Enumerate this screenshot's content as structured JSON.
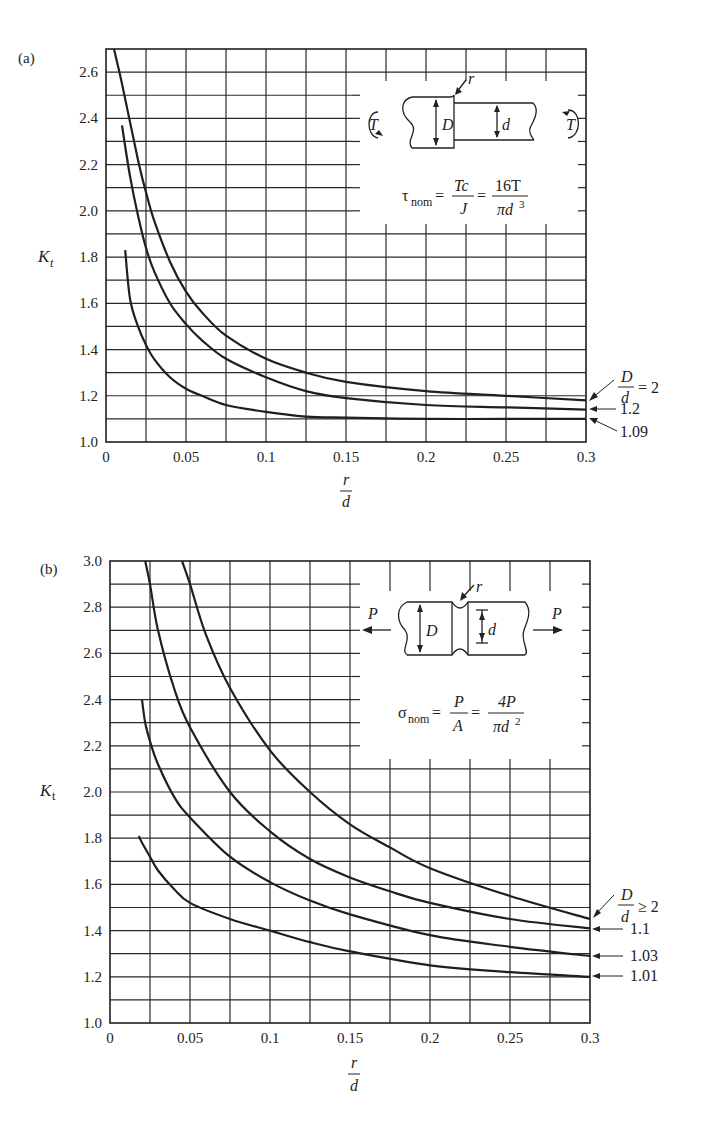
{
  "chart_data": [
    {
      "type": "line",
      "panel": "(a)",
      "title": "Stress concentration factor, stepped shaft in torsion",
      "xlabel": "r/d",
      "ylabel": "K_t",
      "xlim": [
        0,
        0.3
      ],
      "ylim": [
        1.0,
        2.7
      ],
      "xticks": [
        "0",
        "0.05",
        "0.1",
        "0.15",
        "0.2",
        "0.25",
        "0.3"
      ],
      "yticks": [
        "1.0",
        "1.2",
        "1.4",
        "1.6",
        "1.8",
        "2.0",
        "2.2",
        "2.4",
        "2.6"
      ],
      "grid": true,
      "inset": {
        "diagram": "stepped shaft with torque T at both ends, diameters D and d, fillet radius r",
        "formula": "τ_nom = Tc/J = 16T/(πd³)"
      },
      "series": [
        {
          "name": "D/d = 2",
          "x": [
            0.005,
            0.01,
            0.02,
            0.025,
            0.03,
            0.04,
            0.05,
            0.06,
            0.075,
            0.1,
            0.125,
            0.15,
            0.2,
            0.25,
            0.3
          ],
          "y": [
            2.7,
            2.55,
            2.22,
            2.08,
            1.96,
            1.78,
            1.65,
            1.56,
            1.46,
            1.36,
            1.3,
            1.26,
            1.22,
            1.2,
            1.18
          ]
        },
        {
          "name": "1.2",
          "x": [
            0.01,
            0.015,
            0.02,
            0.025,
            0.03,
            0.04,
            0.05,
            0.06,
            0.075,
            0.1,
            0.125,
            0.15,
            0.2,
            0.25,
            0.3
          ],
          "y": [
            2.37,
            2.15,
            1.98,
            1.84,
            1.74,
            1.6,
            1.51,
            1.44,
            1.36,
            1.28,
            1.22,
            1.19,
            1.16,
            1.15,
            1.14
          ]
        },
        {
          "name": "1.09",
          "x": [
            0.012,
            0.015,
            0.02,
            0.025,
            0.03,
            0.04,
            0.05,
            0.06,
            0.075,
            0.1,
            0.125,
            0.15,
            0.2,
            0.25,
            0.3
          ],
          "y": [
            1.83,
            1.62,
            1.5,
            1.42,
            1.36,
            1.28,
            1.23,
            1.2,
            1.16,
            1.13,
            1.11,
            1.105,
            1.1,
            1.1,
            1.1
          ]
        }
      ],
      "annotations": [
        "D/d = 2",
        "1.2",
        "1.09"
      ]
    },
    {
      "type": "line",
      "panel": "(b)",
      "title": "Stress concentration factor, grooved shaft in tension",
      "xlabel": "r/d",
      "ylabel": "K_t",
      "xlim": [
        0,
        0.3
      ],
      "ylim": [
        1.0,
        3.0
      ],
      "xticks": [
        "0",
        "0.05",
        "0.1",
        "0.15",
        "0.2",
        "0.25",
        "0.3"
      ],
      "yticks": [
        "1.0",
        "1.2",
        "1.4",
        "1.6",
        "1.8",
        "2.0",
        "2.2",
        "2.4",
        "2.6",
        "2.8",
        "3.0"
      ],
      "grid": true,
      "inset": {
        "diagram": "grooved round bar under axial load P, diameters D and d, groove radius r",
        "formula": "σ_nom = P/A = 4P/(πd²)"
      },
      "series": [
        {
          "name": "D/d ≥ 2",
          "x": [
            0.045,
            0.05,
            0.06,
            0.075,
            0.1,
            0.125,
            0.15,
            0.175,
            0.2,
            0.25,
            0.3
          ],
          "y": [
            3.0,
            2.9,
            2.68,
            2.45,
            2.18,
            2.0,
            1.86,
            1.76,
            1.67,
            1.55,
            1.45
          ]
        },
        {
          "name": "1.1",
          "x": [
            0.022,
            0.025,
            0.03,
            0.04,
            0.05,
            0.075,
            0.1,
            0.125,
            0.15,
            0.175,
            0.2,
            0.25,
            0.3
          ],
          "y": [
            3.0,
            2.9,
            2.7,
            2.45,
            2.28,
            2.0,
            1.83,
            1.71,
            1.63,
            1.57,
            1.52,
            1.45,
            1.41
          ]
        },
        {
          "name": "1.03",
          "x": [
            0.02,
            0.022,
            0.025,
            0.03,
            0.04,
            0.05,
            0.075,
            0.1,
            0.125,
            0.15,
            0.2,
            0.25,
            0.3
          ],
          "y": [
            2.4,
            2.3,
            2.22,
            2.12,
            1.98,
            1.89,
            1.72,
            1.61,
            1.53,
            1.47,
            1.38,
            1.33,
            1.29
          ]
        },
        {
          "name": "1.01",
          "x": [
            0.018,
            0.02,
            0.025,
            0.03,
            0.04,
            0.05,
            0.075,
            0.1,
            0.125,
            0.15,
            0.2,
            0.25,
            0.3
          ],
          "y": [
            1.81,
            1.78,
            1.72,
            1.66,
            1.58,
            1.52,
            1.45,
            1.4,
            1.35,
            1.31,
            1.25,
            1.22,
            1.2
          ]
        }
      ],
      "annotations": [
        "D/d ≥ 2",
        "1.1",
        "1.03",
        "1.01"
      ]
    }
  ],
  "labels": {
    "a": {
      "panel": "(a)",
      "ylabel": "K",
      "ylabel_sub": "t",
      "xlabel_num": "r",
      "xlabel_den": "d",
      "xticks": [
        "0",
        "0.05",
        "0.1",
        "0.15",
        "0.2",
        "0.25",
        "0.3"
      ],
      "yticks": [
        "1.0",
        "1.2",
        "1.4",
        "1.6",
        "1.8",
        "2.0",
        "2.2",
        "2.4",
        "2.6"
      ],
      "ann_frac_num": "D",
      "ann_frac_den": "d",
      "ann_first": "= 2",
      "ann_2": "1.2",
      "ann_3": "1.09",
      "inset": {
        "T": "T",
        "D": "D",
        "d": "d",
        "r": "r",
        "tau": "τ",
        "nom": "nom",
        "eq": "=",
        "f1_num": "Tc",
        "f1_den": "J",
        "f2_num": "16T",
        "f2_den": "πd",
        "f2_exp": "3"
      }
    },
    "b": {
      "panel": "(b)",
      "ylabel": "K",
      "ylabel_sub": "t",
      "xlabel_num": "r",
      "xlabel_den": "d",
      "xticks": [
        "0",
        "0.05",
        "0.1",
        "0.15",
        "0.2",
        "0.25",
        "0.3"
      ],
      "yticks": [
        "1.0",
        "1.2",
        "1.4",
        "1.6",
        "1.8",
        "2.0",
        "2.2",
        "2.4",
        "2.6",
        "2.8",
        "3.0"
      ],
      "ann_frac_num": "D",
      "ann_frac_den": "d",
      "ann_first": "≥ 2",
      "ann_2": "1.1",
      "ann_3": "1.03",
      "ann_4": "1.01",
      "inset": {
        "P": "P",
        "D": "D",
        "d": "d",
        "r": "r",
        "sigma": "σ",
        "nom": "nom",
        "eq": "=",
        "f1_num": "P",
        "f1_den": "A",
        "f2_num": "4P",
        "f2_den": "πd",
        "f2_exp": "2"
      }
    }
  },
  "colors": {
    "ink": "#1f1f1f",
    "grid": "#2a2a2a",
    "background": "#ffffff"
  }
}
